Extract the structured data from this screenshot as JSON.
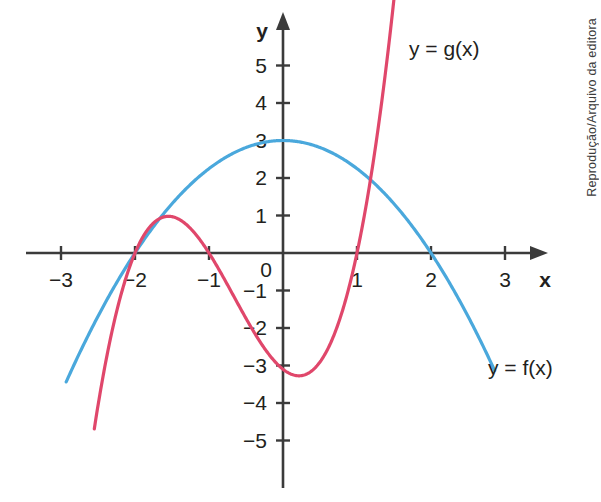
{
  "figure": {
    "credit": "Reprodução/Arquivo da editora",
    "background_color": "#ffffff"
  },
  "axes": {
    "x_axis_name": "x",
    "y_axis_name": "y",
    "origin_label": "0",
    "axis_color": "#3b3b3b",
    "x_ticks": [
      {
        "value": -3,
        "label": "−3"
      },
      {
        "value": -2,
        "label": "−2"
      },
      {
        "value": -1,
        "label": "−1"
      },
      {
        "value": 1,
        "label": "1"
      },
      {
        "value": 2,
        "label": "2"
      },
      {
        "value": 3,
        "label": "3"
      }
    ],
    "y_ticks": [
      {
        "value": 5,
        "label": "5"
      },
      {
        "value": 4,
        "label": "4"
      },
      {
        "value": 3,
        "label": "3"
      },
      {
        "value": 2,
        "label": "2"
      },
      {
        "value": 1,
        "label": "1"
      },
      {
        "value": -1,
        "label": "−1"
      },
      {
        "value": -2,
        "label": "−2"
      },
      {
        "value": -3,
        "label": "−3"
      },
      {
        "value": -4,
        "label": "−4"
      },
      {
        "value": -5,
        "label": "−5"
      }
    ]
  },
  "labels": {
    "g_label": "y = g(x)",
    "f_label": "y = f(x)"
  },
  "chart_data": {
    "type": "line",
    "title": "",
    "xlabel": "x",
    "ylabel": "y",
    "xlim": [
      -3.6,
      3.6
    ],
    "ylim": [
      -5.8,
      6.0
    ],
    "grid": false,
    "legend_position": "inline-annotations",
    "x_ticks": [
      -3,
      -2,
      -1,
      0,
      1,
      2,
      3
    ],
    "y_ticks": [
      -5,
      -4,
      -3,
      -2,
      -1,
      0,
      1,
      2,
      3,
      4,
      5
    ],
    "series": [
      {
        "name": "y = f(x)",
        "color": "#4aa8dc",
        "kind": "parabola",
        "equation": "f(x) = 3 - 0.75x^2",
        "coefficients": {
          "a": -0.75,
          "b": 0,
          "c": 3
        },
        "vertex": [
          0,
          3
        ],
        "roots": [
          -2,
          2
        ],
        "domain_drawn": [
          -2.93,
          2.86
        ],
        "x": [
          -2.93,
          -2.5,
          -2.0,
          -1.5,
          -1.0,
          -0.5,
          0.0,
          0.5,
          1.0,
          1.5,
          2.0,
          2.5,
          2.86
        ],
        "values": [
          -3.44,
          -1.69,
          0.0,
          1.31,
          2.25,
          2.81,
          3.0,
          2.81,
          2.25,
          1.31,
          0.0,
          -1.69,
          -3.13
        ]
      },
      {
        "name": "y = g(x)",
        "color": "#e0476b",
        "kind": "cubic",
        "equation": "g(x) = 1.55(x + 2)(x + 1)(x - 1)",
        "roots": [
          -2,
          -1,
          1
        ],
        "local_max": [
          -1.55,
          0.62
        ],
        "local_min": [
          0.33,
          -2.1
        ],
        "domain_drawn": [
          -2.55,
          1.78
        ],
        "x": [
          -2.55,
          -2.25,
          -2.0,
          -1.75,
          -1.55,
          -1.25,
          -1.0,
          -0.75,
          -0.5,
          0.0,
          0.33,
          0.75,
          1.0,
          1.25,
          1.5,
          1.78
        ],
        "values": [
          -3.12,
          -1.21,
          0.0,
          0.51,
          0.62,
          0.41,
          0.0,
          -0.68,
          -1.16,
          -2.0,
          -2.1,
          -1.49,
          0.0,
          2.27,
          5.43,
          9.5
        ]
      }
    ],
    "intersections": [
      {
        "x": -2,
        "y": 0,
        "note": "both curves meet the x-axis and each other"
      }
    ]
  }
}
